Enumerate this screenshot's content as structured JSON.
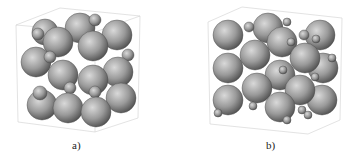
{
  "figure": {
    "panels": [
      {
        "id": "a",
        "label": "a)"
      },
      {
        "id": "b",
        "label": "b)"
      }
    ],
    "colors": {
      "sphere_light": "#d8d8d8",
      "sphere_dark": "#5a5a5a",
      "box_edge": "#cfcfcf",
      "background": "#ffffff"
    }
  }
}
